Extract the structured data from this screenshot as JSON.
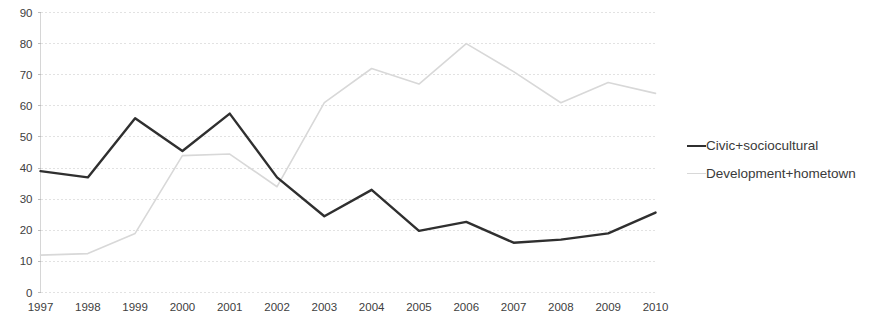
{
  "chart_data": {
    "type": "line",
    "title": "",
    "subtitle": "",
    "xlabel": "",
    "ylabel": "",
    "categories": [
      "1997",
      "1998",
      "1999",
      "2000",
      "2001",
      "2002",
      "2003",
      "2004",
      "2005",
      "2006",
      "2007",
      "2008",
      "2009",
      "2010"
    ],
    "xlim": [
      1997,
      2010
    ],
    "ylim": [
      0,
      90
    ],
    "ytick_labels": [
      "0",
      "10",
      "20",
      "30",
      "40",
      "50",
      "60",
      "70",
      "80",
      "90"
    ],
    "ytick_values": [
      0,
      10,
      20,
      30,
      40,
      50,
      60,
      70,
      80,
      90
    ],
    "ytick_step": 10,
    "grid": true,
    "grid_style": "dotted-horizontal",
    "legend_position": "right",
    "series": [
      {
        "name": "Civic+sociocultural",
        "color": "#2f2f2f",
        "style": "solid",
        "width": 2.4,
        "values": [
          39,
          37,
          56,
          45.5,
          57.5,
          37,
          24.5,
          33,
          19.8,
          22.7,
          16,
          17,
          19,
          25.7
        ]
      },
      {
        "name": "Development+hometown",
        "color": "#d8d8d8",
        "style": "solid",
        "width": 1.6,
        "values": [
          12,
          12.5,
          19,
          44,
          44.5,
          34,
          61,
          72,
          67,
          80,
          71,
          61,
          67.5,
          64
        ]
      }
    ]
  },
  "legend": {
    "entries": [
      {
        "label": "Civic+sociocultural"
      },
      {
        "label": "Development+hometown"
      }
    ]
  },
  "axes": {
    "y_axis_name": "value-axis",
    "x_axis_name": "year-axis"
  }
}
